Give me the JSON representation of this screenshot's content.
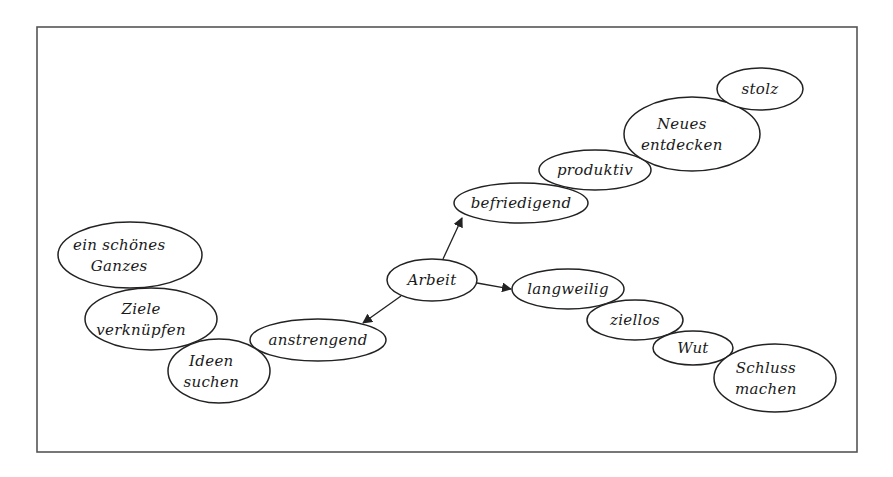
{
  "diagram": {
    "title": "",
    "frame": {
      "x": 37,
      "y": 27,
      "width": 820,
      "height": 425
    },
    "colors": {
      "stroke": "#222222",
      "frame": "#555555",
      "background": "#ffffff"
    },
    "center": "arbeit",
    "nodes": [
      {
        "id": "arbeit",
        "lines": [
          "Arbeit"
        ],
        "cx": 432,
        "cy": 280,
        "rx": 45,
        "ry": 21
      },
      {
        "id": "befriedigend",
        "lines": [
          "befriedigend"
        ],
        "cx": 521,
        "cy": 203,
        "rx": 67,
        "ry": 20
      },
      {
        "id": "produktiv",
        "lines": [
          "produktiv"
        ],
        "cx": 595,
        "cy": 170,
        "rx": 56,
        "ry": 20
      },
      {
        "id": "neues-entdecken",
        "lines": [
          "Neues",
          "entdecken"
        ],
        "cx": 692,
        "cy": 134,
        "rx": 68,
        "ry": 37
      },
      {
        "id": "stolz",
        "lines": [
          "stolz"
        ],
        "cx": 760,
        "cy": 89,
        "rx": 43,
        "ry": 21
      },
      {
        "id": "langweilig",
        "lines": [
          "langweilig"
        ],
        "cx": 568,
        "cy": 289,
        "rx": 56,
        "ry": 20
      },
      {
        "id": "ziellos",
        "lines": [
          "ziellos"
        ],
        "cx": 635,
        "cy": 320,
        "rx": 48,
        "ry": 20
      },
      {
        "id": "wut",
        "lines": [
          "Wut"
        ],
        "cx": 693,
        "cy": 348,
        "rx": 40,
        "ry": 17
      },
      {
        "id": "schluss-machen",
        "lines": [
          "Schluss",
          "machen"
        ],
        "cx": 775,
        "cy": 378,
        "rx": 61,
        "ry": 34
      },
      {
        "id": "anstrengend",
        "lines": [
          "anstrengend"
        ],
        "cx": 318,
        "cy": 340,
        "rx": 68,
        "ry": 21
      },
      {
        "id": "ideen-suchen",
        "lines": [
          "Ideen",
          "suchen"
        ],
        "cx": 219,
        "cy": 371,
        "rx": 51,
        "ry": 32
      },
      {
        "id": "ziele-verknuepfen",
        "lines": [
          "Ziele",
          "verknüpfen"
        ],
        "cx": 151,
        "cy": 319,
        "rx": 66,
        "ry": 31
      },
      {
        "id": "ein-schoenes-ganzes",
        "lines": [
          "ein schönes",
          "Ganzes"
        ],
        "cx": 130,
        "cy": 255,
        "rx": 72,
        "ry": 33
      }
    ],
    "edges": [
      {
        "from": "arbeit",
        "to": "befriedigend",
        "x1": 443,
        "y1": 259,
        "x2": 462,
        "y2": 218
      },
      {
        "from": "arbeit",
        "to": "langweilig",
        "x1": 477,
        "y1": 283,
        "x2": 511,
        "y2": 289
      },
      {
        "from": "arbeit",
        "to": "anstrengend",
        "x1": 401,
        "y1": 296,
        "x2": 363,
        "y2": 323
      }
    ],
    "chains": [
      [
        "befriedigend",
        "produktiv",
        "neues-entdecken",
        "stolz"
      ],
      [
        "langweilig",
        "ziellos",
        "wut",
        "schluss-machen"
      ],
      [
        "anstrengend",
        "ideen-suchen",
        "ziele-verknuepfen",
        "ein-schoenes-ganzes"
      ]
    ]
  }
}
